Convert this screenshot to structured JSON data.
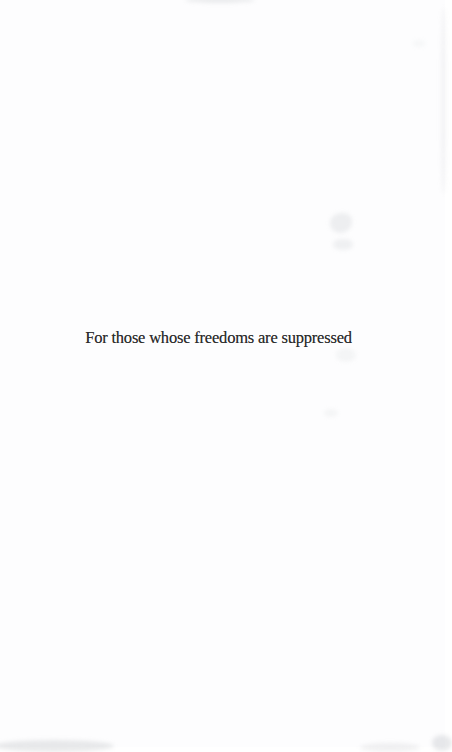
{
  "page": {
    "type": "book-dedication-page",
    "dedication_text": "For those whose freedoms are suppressed",
    "text_color": "#2b2b2b",
    "background_color": "#fdfdfe"
  }
}
